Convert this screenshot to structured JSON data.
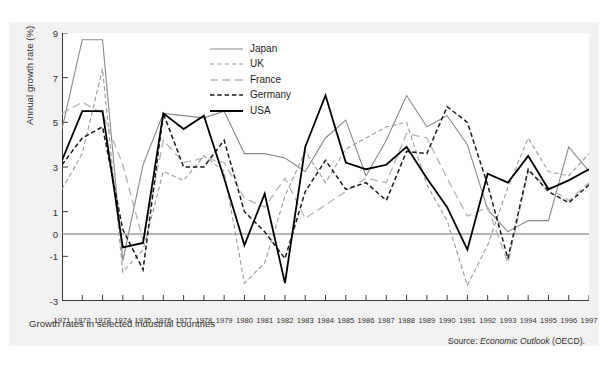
{
  "figure": {
    "caption": "Growth rates in selected industrial countries",
    "source_prefix": "Source: ",
    "source_italic": "Economic Outlook",
    "source_suffix": " (OECD)."
  },
  "chart_data": {
    "type": "line",
    "title": "Growth rates in selected industrial countries",
    "xlabel": "",
    "ylabel": "Annual growth rate (%)",
    "ylim": [
      -3,
      9
    ],
    "xlim": [
      1971,
      1997
    ],
    "grid": false,
    "zero_line": true,
    "legend_position": "top-center",
    "yticks": [
      9,
      7,
      5,
      3,
      1,
      0,
      -1,
      -3
    ],
    "ytick_labels": [
      "9",
      "7",
      "5",
      "3",
      "1",
      "0",
      "-1",
      "-3"
    ],
    "x": [
      1971,
      1972,
      1973,
      1974,
      1975,
      1976,
      1977,
      1978,
      1979,
      1980,
      1981,
      1982,
      1983,
      1984,
      1985,
      1986,
      1987,
      1988,
      1989,
      1990,
      1991,
      1992,
      1993,
      1994,
      1995,
      1996,
      1997
    ],
    "xtick_labels": [
      "1971",
      "1972",
      "1973",
      "1974",
      "1975",
      "1976",
      "1977",
      "1978",
      "1979",
      "1980",
      "1981",
      "1982",
      "1983",
      "1984",
      "1985",
      "1986",
      "1987",
      "1988",
      "1989",
      "1990",
      "1991",
      "1992",
      "1993",
      "1994",
      "1995",
      "1996",
      "1997"
    ],
    "series": [
      {
        "name": "Japan",
        "color": "#8a8a8a",
        "style": "solid",
        "width": 1.1,
        "values": [
          4.7,
          8.7,
          8.7,
          -1.2,
          3.1,
          5.4,
          5.3,
          5.2,
          5.5,
          3.6,
          3.6,
          3.4,
          2.8,
          4.3,
          5.1,
          2.6,
          4.2,
          6.2,
          4.8,
          5.3,
          4.0,
          1.1,
          0.1,
          0.6,
          0.6,
          3.9,
          2.8
        ]
      },
      {
        "name": "UK",
        "color": "#9a9a9a",
        "style": "dashed",
        "width": 1.1,
        "values": [
          2.0,
          3.6,
          7.4,
          -1.7,
          -0.7,
          2.8,
          2.4,
          3.5,
          2.8,
          -2.2,
          -1.3,
          1.7,
          3.7,
          2.3,
          3.8,
          4.3,
          4.8,
          5.0,
          2.2,
          0.6,
          -2.3,
          -0.5,
          2.1,
          4.3,
          2.8,
          2.6,
          3.6
        ]
      },
      {
        "name": "France",
        "color": "#b4b4b4",
        "style": "longdash",
        "width": 1.3,
        "values": [
          5.4,
          5.9,
          5.4,
          3.1,
          -0.3,
          4.2,
          3.2,
          3.4,
          3.2,
          1.6,
          1.2,
          2.5,
          0.7,
          1.3,
          1.9,
          2.5,
          2.3,
          4.5,
          4.3,
          2.5,
          0.8,
          1.2,
          -1.3,
          2.8,
          2.1,
          1.5,
          2.3
        ]
      },
      {
        "name": "Germany",
        "color": "#1a1a1a",
        "style": "dashed",
        "width": 1.5,
        "values": [
          3.1,
          4.3,
          4.8,
          0.2,
          -1.6,
          5.4,
          3.0,
          3.0,
          4.2,
          1.0,
          0.1,
          -1.1,
          1.9,
          3.3,
          2.0,
          2.3,
          1.5,
          3.7,
          3.6,
          5.7,
          5.0,
          2.2,
          -1.1,
          2.9,
          1.9,
          1.4,
          2.2
        ]
      },
      {
        "name": "USA",
        "color": "#000000",
        "style": "solid",
        "width": 1.8,
        "values": [
          3.3,
          5.5,
          5.5,
          -0.6,
          -0.4,
          5.4,
          4.7,
          5.3,
          2.5,
          -0.5,
          1.8,
          -2.2,
          3.9,
          6.2,
          3.2,
          2.9,
          3.1,
          3.9,
          2.5,
          1.2,
          -0.7,
          2.7,
          2.3,
          3.5,
          2.0,
          2.4,
          2.9
        ]
      }
    ]
  }
}
